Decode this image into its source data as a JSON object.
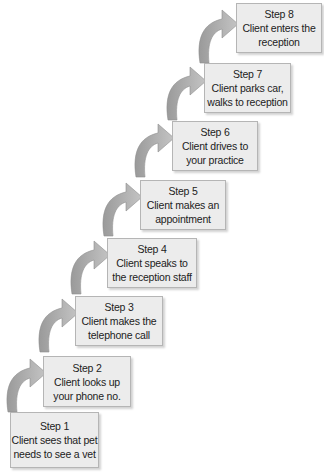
{
  "diagram": {
    "type": "staircase-flow",
    "colors": {
      "box_fill": "#ececec",
      "box_border": "#b5b5b5",
      "arrow_fill": "#a9a9a9",
      "text": "#222222",
      "background": "#ffffff"
    },
    "steps": [
      {
        "title": "Step 1",
        "line1": "Client sees that pet",
        "line2": "needs to see a vet"
      },
      {
        "title": "Step 2",
        "line1": "Client looks up",
        "line2": "your phone no."
      },
      {
        "title": "Step 3",
        "line1": "Client makes the",
        "line2": "telephone call"
      },
      {
        "title": "Step 4",
        "line1": "Client speaks to",
        "line2": "the reception staff"
      },
      {
        "title": "Step 5",
        "line1": "Client makes an",
        "line2": "appointment"
      },
      {
        "title": "Step 6",
        "line1": "Client drives to",
        "line2": "your practice"
      },
      {
        "title": "Step 7",
        "line1": "Client parks car,",
        "line2": "walks to reception"
      },
      {
        "title": "Step 8",
        "line1": "Client enters the",
        "line2": "reception"
      }
    ],
    "arrow_icon": "curved-arrow-up-right"
  }
}
